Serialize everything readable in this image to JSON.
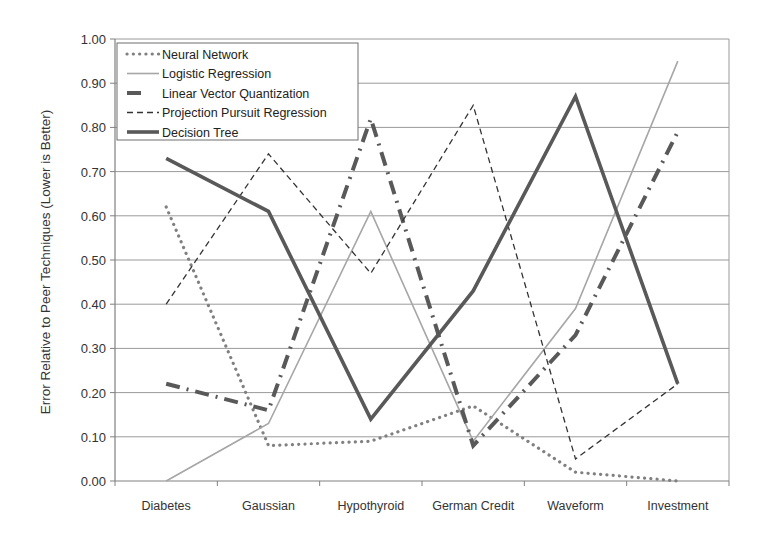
{
  "chart_data": {
    "type": "line",
    "title": "",
    "xlabel": "",
    "ylabel": "Error Relative to Peer Techniques (Lower is Better)",
    "ylim": [
      0,
      1
    ],
    "yticks": [
      "0.00",
      "0.10",
      "0.20",
      "0.30",
      "0.40",
      "0.50",
      "0.60",
      "0.70",
      "0.80",
      "0.90",
      "1.00"
    ],
    "grid": true,
    "legend_position": "upper-left inside",
    "categories": [
      "Diabetes",
      "Gaussian",
      "Hypothyroid",
      "German Credit",
      "Waveform",
      "Investment"
    ],
    "series": [
      {
        "name": "Neural Network",
        "style": "dotted",
        "color": "#808080",
        "values": [
          0.62,
          0.08,
          0.09,
          0.17,
          0.02,
          0.0
        ]
      },
      {
        "name": "Logistic Regression",
        "style": "solid-thin",
        "color": "#a6a6a6",
        "values": [
          0.0,
          0.13,
          0.61,
          0.09,
          0.39,
          0.95
        ]
      },
      {
        "name": "Linear Vector Quantization",
        "style": "dash-dot-thick",
        "color": "#595959",
        "values": [
          0.22,
          0.16,
          0.82,
          0.08,
          0.33,
          0.79
        ]
      },
      {
        "name": "Projection Pursuit Regression",
        "style": "dashed-thin",
        "color": "#333333",
        "values": [
          0.4,
          0.74,
          0.47,
          0.85,
          0.05,
          0.22
        ]
      },
      {
        "name": "Decision Tree",
        "style": "solid-thick",
        "color": "#595959",
        "values": [
          0.73,
          0.61,
          0.14,
          0.43,
          0.87,
          0.22
        ]
      }
    ]
  }
}
